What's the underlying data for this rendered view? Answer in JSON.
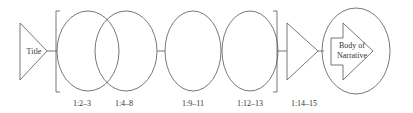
{
  "diagram": {
    "start": {
      "label": "Title"
    },
    "segments": [
      {
        "label": "1:2–3"
      },
      {
        "label": "1:4–8"
      },
      {
        "label": "1:9–11"
      },
      {
        "label": "1:12–13"
      },
      {
        "label": "1:14–15"
      }
    ],
    "end": {
      "line1": "Body of",
      "line2": "Narrative"
    },
    "stroke_color": "#555555"
  }
}
